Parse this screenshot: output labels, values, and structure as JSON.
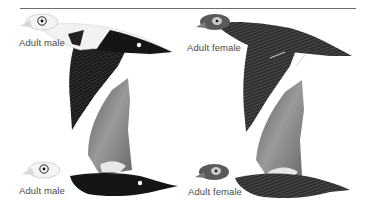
{
  "plate": {
    "labels": {
      "top_left": "Adult male",
      "top_right": "Adult female",
      "bottom_left": "Adult male",
      "bottom_right": "Adult female"
    },
    "figures": [
      {
        "id": "male-upper",
        "subject": "Adult male",
        "pose": "flight, wings down"
      },
      {
        "id": "female-upper",
        "subject": "Adult female",
        "pose": "flight, wings down"
      },
      {
        "id": "male-lower",
        "subject": "Adult male",
        "pose": "flight, wings up"
      },
      {
        "id": "female-lower",
        "subject": "Adult female",
        "pose": "flight, wings up"
      }
    ],
    "colors": {
      "male_black": "#151515",
      "male_white": "#f2f2f2",
      "female_brown": "#3d3d3d",
      "wing_gray": "#8a8a8a",
      "rule": "#6e6e6e",
      "label_text": "#4a4a4a"
    }
  }
}
